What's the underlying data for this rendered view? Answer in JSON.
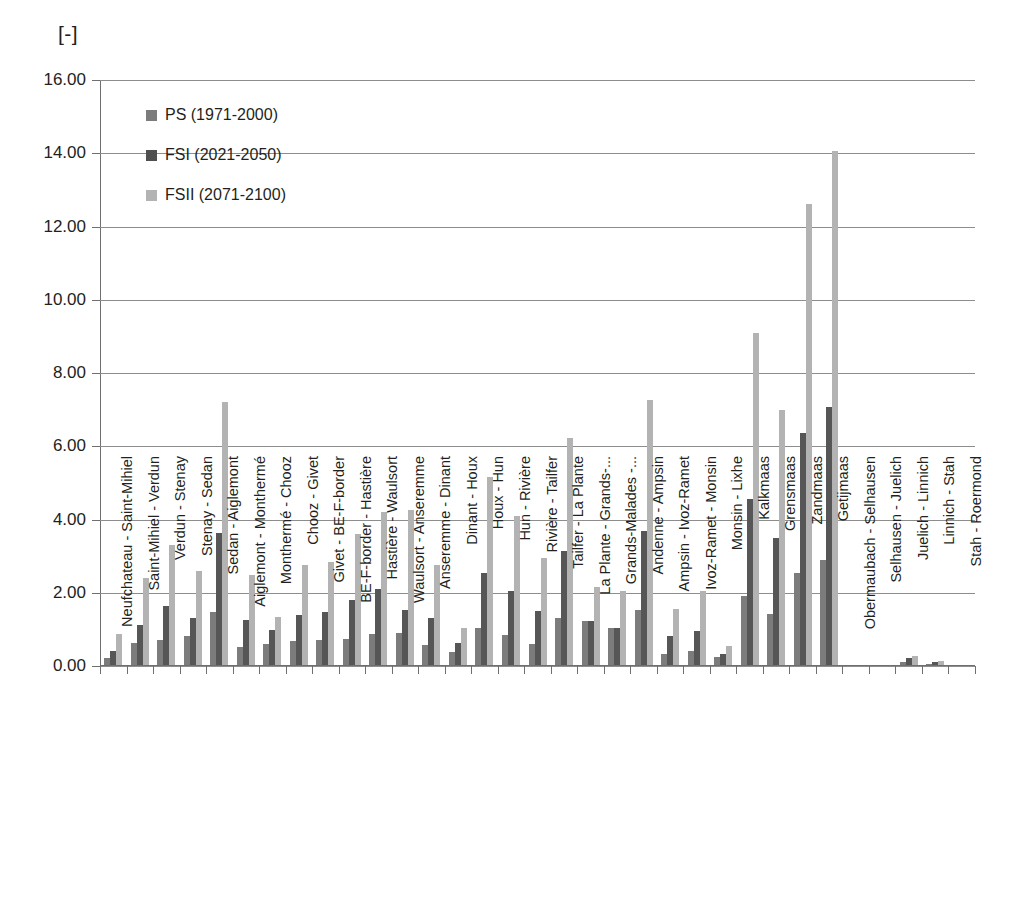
{
  "chart_data": {
    "type": "bar",
    "title": "",
    "subtitle": "",
    "unit_label": "[-]",
    "xlabel": "",
    "ylabel": "",
    "ylim": [
      0,
      16
    ],
    "ytick_step": 2,
    "ytick_labels": [
      "0.00",
      "2.00",
      "4.00",
      "6.00",
      "8.00",
      "10.00",
      "12.00",
      "14.00",
      "16.00"
    ],
    "grid": true,
    "legend_position": "inside-top-left",
    "colors": {
      "ps": "#7c7c7c",
      "fsi": "#565656",
      "fsii": "#b3b3b3"
    },
    "categories": [
      "Neufchateau - Saint-Mihiel",
      "Saint-Mihiel - Verdun",
      "Verdun - Stenay",
      "Stenay - Sedan",
      "Sedan - Aiglemont",
      "Aiglemont - Monthermé",
      "Monthermé - Chooz",
      "Chooz - Givet",
      "Givet - BE-F-border",
      "BE-F-border - Hastière",
      "Hastière - Waulsort",
      "Waulsort - Anseremme",
      "Anseremme - Dinant",
      "Dinant - Houx",
      "Houx - Hun",
      "Hun - Rivière",
      "Rivière - Tailfer",
      "Tailfer - La Plante",
      "La Plante - Grands-...",
      "Grands-Malades -...",
      "Andenne - Ampsin",
      "Ampsin - Ivoz-Ramet",
      "Ivoz-Ramet - Monsin",
      "Monsin - Lixhe",
      "Kalkmaas",
      "Grensmaas",
      "Zandmaas",
      "Getijmaas",
      "Obermaubach - Selhausen",
      "Selhausen - Juelich",
      "Juelich - Linnich",
      "Linnich - Stah",
      "Stah - Roermond"
    ],
    "series": [
      {
        "name": "PS (1971-2000)",
        "key": "ps",
        "values": [
          0.22,
          0.62,
          0.7,
          0.83,
          1.47,
          0.52,
          0.6,
          0.67,
          0.72,
          0.75,
          0.88,
          0.9,
          0.58,
          0.38,
          1.05,
          0.85,
          0.6,
          1.32,
          1.22,
          1.05,
          1.52,
          0.33,
          0.4,
          0.25,
          1.9,
          1.42,
          2.55,
          2.9,
          0.0,
          0.0,
          0.12,
          0.05,
          0.0
        ]
      },
      {
        "name": "FSI (2021-2050)",
        "key": "fsi",
        "values": [
          0.42,
          1.12,
          1.65,
          1.32,
          3.62,
          1.25,
          0.98,
          1.4,
          1.48,
          1.8,
          2.1,
          1.52,
          1.3,
          0.62,
          2.55,
          2.05,
          1.5,
          3.15,
          1.22,
          1.05,
          3.7,
          0.82,
          0.95,
          0.32,
          4.55,
          3.5,
          6.35,
          7.08,
          0.0,
          0.0,
          0.22,
          0.1,
          0.0
        ]
      },
      {
        "name": "FSII (2071-2100)",
        "key": "fsii",
        "values": [
          0.88,
          2.4,
          3.3,
          2.6,
          7.2,
          2.48,
          1.35,
          2.75,
          2.85,
          3.6,
          4.2,
          4.25,
          2.75,
          1.05,
          5.15,
          4.1,
          2.95,
          6.22,
          2.15,
          2.05,
          7.25,
          1.55,
          2.05,
          0.55,
          9.1,
          7.0,
          12.62,
          14.05,
          0.0,
          0.0,
          0.28,
          0.15,
          0.0
        ]
      }
    ]
  },
  "legend": {
    "items": [
      {
        "label": "PS (1971-2000)",
        "key": "ps"
      },
      {
        "label": "FSI (2021-2050)",
        "key": "fsi"
      },
      {
        "label": "FSII (2071-2100)",
        "key": "fsii"
      }
    ]
  }
}
